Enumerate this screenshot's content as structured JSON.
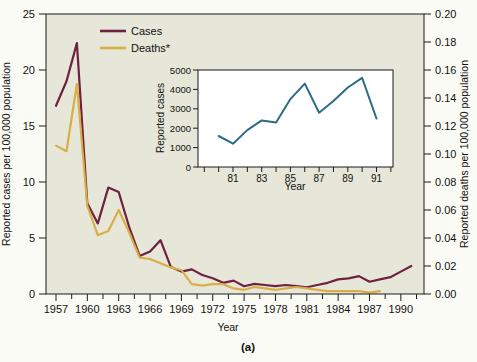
{
  "figure": {
    "caption": "(a)",
    "background": "#fbfbf5",
    "panel_color": "#e6e7d8",
    "frame_color": "#1a1a1a"
  },
  "chart_data": {
    "main": {
      "type": "line",
      "xlabel": "Year",
      "ylabel_left": "Reported cases per 100,000 population",
      "ylabel_right": "Reported deaths per 100,000 population",
      "xlim": [
        1956,
        1992
      ],
      "ylim_left": [
        0,
        25
      ],
      "ylim_right": [
        0.0,
        0.2
      ],
      "x_ticks": [
        1957,
        1960,
        1963,
        1966,
        1969,
        1972,
        1975,
        1978,
        1981,
        1984,
        1987,
        1990
      ],
      "y_ticks_left": [
        0,
        5,
        10,
        15,
        20,
        25
      ],
      "y_ticks_right": [
        "0.00",
        "0.02",
        "0.04",
        "0.06",
        "0.08",
        "0.10",
        "0.12",
        "0.14",
        "0.16",
        "0.18",
        "0.20"
      ],
      "grid": false,
      "legend_position": "top-left-inside",
      "legend": [
        {
          "label": "Cases",
          "color": "#6e2140"
        },
        {
          "label": "Deaths*",
          "color": "#d9ae47"
        }
      ],
      "series": [
        {
          "name": "Cases",
          "axis": "left",
          "color": "#6e2140",
          "years": [
            1957,
            1958,
            1959,
            1960,
            1961,
            1962,
            1963,
            1964,
            1965,
            1966,
            1967,
            1968,
            1969,
            1970,
            1971,
            1972,
            1973,
            1974,
            1975,
            1976,
            1977,
            1978,
            1979,
            1980,
            1981,
            1982,
            1983,
            1984,
            1985,
            1986,
            1987,
            1988,
            1989,
            1990,
            1991
          ],
          "values": [
            16.8,
            19.0,
            22.4,
            8.1,
            6.3,
            9.5,
            9.1,
            6.0,
            3.4,
            3.8,
            4.8,
            2.4,
            2.0,
            2.2,
            1.7,
            1.4,
            1.0,
            1.2,
            0.7,
            0.9,
            0.8,
            0.7,
            0.8,
            0.7,
            0.6,
            0.8,
            1.0,
            1.3,
            1.4,
            1.6,
            1.1,
            1.3,
            1.5,
            2.0,
            2.5
          ]
        },
        {
          "name": "Deaths*",
          "axis": "right",
          "color": "#d9ae47",
          "years": [
            1957,
            1958,
            1959,
            1960,
            1961,
            1962,
            1963,
            1964,
            1965,
            1966,
            1967,
            1968,
            1969,
            1970,
            1971,
            1972,
            1973,
            1974,
            1975,
            1976,
            1977,
            1978,
            1979,
            1980,
            1981,
            1982,
            1983,
            1984,
            1985,
            1986,
            1987,
            1988
          ],
          "values": [
            0.106,
            0.102,
            0.15,
            0.063,
            0.042,
            0.045,
            0.06,
            0.044,
            0.026,
            0.025,
            0.022,
            0.019,
            0.017,
            0.007,
            0.006,
            0.007,
            0.007,
            0.004,
            0.003,
            0.005,
            0.004,
            0.003,
            0.004,
            0.005,
            0.004,
            0.003,
            0.002,
            0.002,
            0.002,
            0.002,
            0.001,
            0.002
          ]
        }
      ]
    },
    "inset": {
      "type": "line",
      "xlabel": "Year",
      "ylabel": "Reported cases",
      "xlim": [
        79,
        92
      ],
      "ylim": [
        0,
        5000
      ],
      "x_tick_labels": [
        81,
        83,
        85,
        87,
        89,
        91
      ],
      "x_minor_ticks_every_year": true,
      "y_ticks": [
        0,
        1000,
        2000,
        3000,
        4000,
        5000
      ],
      "panel_color": "#ffffff",
      "color": "#2d6b89",
      "years": [
        80,
        81,
        82,
        83,
        84,
        85,
        86,
        87,
        88,
        89,
        90,
        91
      ],
      "values": [
        1600,
        1200,
        1900,
        2400,
        2300,
        3500,
        4300,
        2800,
        3400,
        4100,
        4600,
        2500
      ]
    }
  }
}
